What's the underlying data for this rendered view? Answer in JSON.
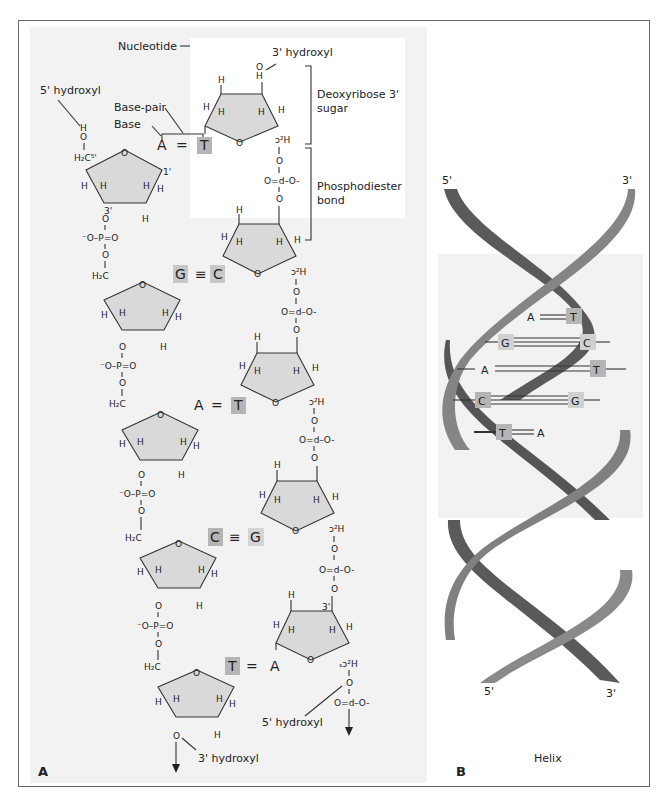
{
  "panel_a": {
    "letter": "A",
    "labels": {
      "nucleotide": "Nucleotide",
      "three_hydroxyl_top": "3' hydroxyl",
      "five_hydroxyl_top": "5' hydroxyl",
      "base_pair": "Base-pair",
      "base": "Base",
      "deoxyribose_line1": "Deoxyribose 3'",
      "deoxyribose_line2": "sugar",
      "phosphodiester_line1": "Phosphodiester",
      "phosphodiester_line2": "bond",
      "five_hydroxyl_bottom": "5' hydroxyl",
      "three_hydroxyl_bottom": "3' hydroxyl"
    },
    "atoms": {
      "H": "H",
      "O": "O",
      "H2C": "H₂C",
      "H2C5": "H₂C⁵'",
      "one_prime": "1'",
      "three_prime": "3'",
      "phosphate_left": "⁻O–P=O",
      "phosphate_right": "O=d–O-",
      "ch2_flipped": "ɔ²H",
      "ch2_5_flipped": "ₛɔ²H"
    },
    "base_pairs": [
      {
        "left": "A",
        "bond": "=",
        "right": "T",
        "left_shaded": false,
        "right_shaded": true
      },
      {
        "left": "G",
        "bond": "≡",
        "right": "C",
        "left_shaded": true,
        "right_shaded": true
      },
      {
        "left": "A",
        "bond": "=",
        "right": "T",
        "left_shaded": false,
        "right_shaded": true
      },
      {
        "left": "C",
        "bond": "≡",
        "right": "G",
        "left_shaded": true,
        "right_shaded": true
      },
      {
        "left": "T",
        "bond": "=",
        "right": "A",
        "left_shaded": true,
        "right_shaded": false
      }
    ]
  },
  "panel_b": {
    "letter": "B",
    "caption": "Helix",
    "top_left_end": "5'",
    "top_right_end": "3'",
    "bottom_left_end": "5'",
    "bottom_right_end": "3'",
    "rungs": [
      {
        "left": "A",
        "right": "T",
        "bonds": 2
      },
      {
        "left": "G",
        "right": "C",
        "bonds": 3
      },
      {
        "left": "A",
        "right": "T",
        "bonds": 2
      },
      {
        "left": "C",
        "right": "G",
        "bonds": 3
      },
      {
        "left": "T",
        "right": "A",
        "bonds": 2
      }
    ]
  },
  "colors": {
    "strand_dark": "#5a5a5a",
    "strand_light": "#8a8a8a",
    "sugar_fill": "#d9d9d9",
    "base_shade": "#b5b5b5",
    "panel_bg": "#f2f2f2"
  }
}
